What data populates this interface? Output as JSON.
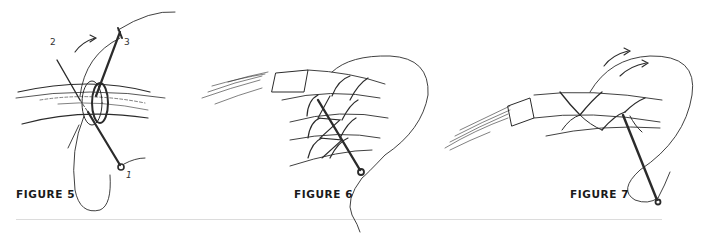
{
  "figures": [
    {
      "id": "figure-5",
      "label": "FIGURE 5",
      "step_numbers": {
        "one": "1",
        "two": "2",
        "three": "3"
      }
    },
    {
      "id": "figure-6",
      "label": "FIGURE 6"
    },
    {
      "id": "figure-7",
      "label": "FIGURE 7"
    }
  ],
  "colors": {
    "ink": "#2b2b2b",
    "text": "#1a1a1a",
    "rule": "#dcdcdc",
    "background": "#ffffff"
  }
}
